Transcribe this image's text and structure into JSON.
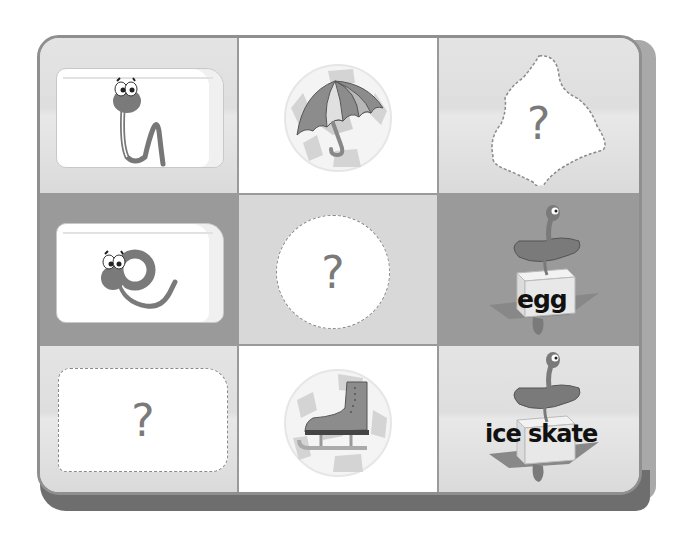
{
  "board": {
    "rows": 3,
    "cols": 3,
    "colors": {
      "frame": "#8f8f8f",
      "shadow_bottom": "#6e6e6e",
      "shadow_right": "#a9a9a9",
      "cell_light": "#dedede",
      "cell_mid": "#d8d8d8",
      "cell_dark": "#9a9a9a",
      "cell_white": "#ffffff",
      "placeholder_border": "#8a8a8a",
      "question_mark": "#7a7a7a"
    }
  },
  "cells": [
    {
      "row": 1,
      "col": 1,
      "type": "ice-block",
      "content": "snake-letter-u",
      "icon": "snake-u-icon"
    },
    {
      "row": 1,
      "col": 2,
      "type": "picture-ball",
      "content": "umbrella",
      "icon": "umbrella-icon"
    },
    {
      "row": 1,
      "col": 3,
      "type": "placeholder",
      "shape": "blob",
      "text": "?"
    },
    {
      "row": 2,
      "col": 1,
      "type": "ice-block",
      "content": "snake-letter-e",
      "icon": "snake-e-icon"
    },
    {
      "row": 2,
      "col": 2,
      "type": "placeholder",
      "shape": "circle",
      "text": "?"
    },
    {
      "row": 2,
      "col": 3,
      "type": "word-card",
      "content": "dragon-on-block",
      "icon": "dragon-icon",
      "word": "egg"
    },
    {
      "row": 3,
      "col": 1,
      "type": "placeholder",
      "shape": "rounded-rect",
      "text": "?"
    },
    {
      "row": 3,
      "col": 2,
      "type": "picture-ball",
      "content": "ice skate",
      "icon": "ice-skate-icon"
    },
    {
      "row": 3,
      "col": 3,
      "type": "word-card",
      "content": "dragon-on-block",
      "icon": "dragon-icon",
      "word": "ice skate"
    }
  ]
}
